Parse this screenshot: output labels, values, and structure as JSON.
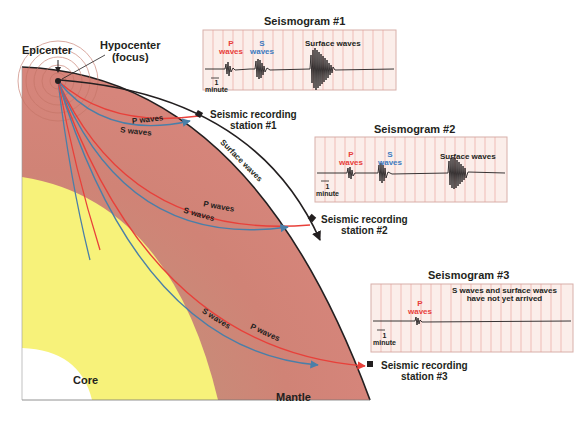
{
  "labels": {
    "epicenter": "Epicenter",
    "hypocenter_line1": "Hypocenter",
    "hypocenter_line2": "(focus)",
    "core": "Core",
    "mantle": "Mantle",
    "surface_waves": "Surface waves",
    "p_waves": "P waves",
    "s_waves": "S waves"
  },
  "stations": [
    {
      "line1": "Seismic recording",
      "line2": "station #1"
    },
    {
      "line1": "Seismic recording",
      "line2": "station #2"
    },
    {
      "line1": "Seismic recording",
      "line2": "station #3"
    }
  ],
  "seismograms": [
    {
      "title": "Seismogram #1",
      "p_label": "P",
      "p_label2": "waves",
      "s_label": "S",
      "s_label2": "waves",
      "surface_label": "Surface waves",
      "scale_value": "1",
      "scale_unit": "minute"
    },
    {
      "title": "Seismogram #2",
      "p_label": "P",
      "p_label2": "waves",
      "s_label": "S",
      "s_label2": "waves",
      "surface_label": "Surface waves",
      "scale_value": "1",
      "scale_unit": "minute"
    },
    {
      "title": "Seismogram #3",
      "p_label": "P",
      "p_label2": "waves",
      "note_line1": "S waves and surface waves",
      "note_line2": "have not yet arrived",
      "scale_value": "1",
      "scale_unit": "minute"
    }
  ],
  "colors": {
    "mantle": "#d48a7c",
    "core_outer": "#f7f27a",
    "core_inner": "#ffffff",
    "p_wave": "#e8403a",
    "s_wave": "#4a7fa8",
    "surface_wave": "#231f20",
    "grid_bg": "#fbeeea",
    "grid_line": "#e89a94"
  }
}
